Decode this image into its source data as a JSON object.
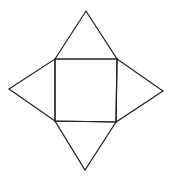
{
  "diagram": {
    "stroke_color": "#222222",
    "background": "#ffffff",
    "square": {
      "points": [
        [
          55,
          59
        ],
        [
          117,
          59
        ],
        [
          116,
          122
        ],
        [
          55,
          121
        ]
      ]
    },
    "triangles": [
      {
        "name": "top",
        "points": [
          [
            55,
            59
          ],
          [
            86,
            11
          ],
          [
            117,
            59
          ]
        ]
      },
      {
        "name": "right",
        "points": [
          [
            117,
            59
          ],
          [
            163,
            91
          ],
          [
            116,
            122
          ]
        ]
      },
      {
        "name": "bottom",
        "points": [
          [
            116,
            122
          ],
          [
            85,
            170
          ],
          [
            55,
            121
          ]
        ]
      },
      {
        "name": "left",
        "points": [
          [
            55,
            121
          ],
          [
            9,
            89
          ],
          [
            55,
            59
          ]
        ]
      }
    ]
  }
}
